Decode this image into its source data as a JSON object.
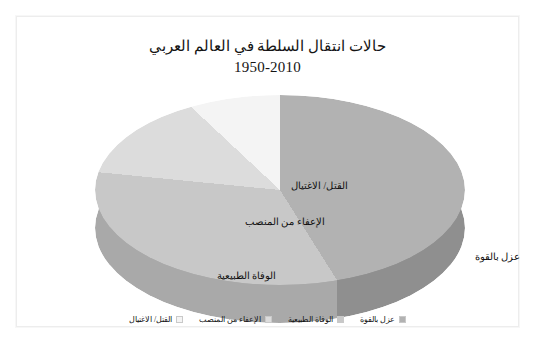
{
  "chart_data": {
    "type": "pie",
    "title": "حالات انتقال السلطة في العالم العربي",
    "subtitle": "1950-2010",
    "xlabel": "",
    "ylabel": "",
    "legend_position": "bottom",
    "grid": false,
    "three_d": true,
    "categories": [
      "عزل بالقوة",
      "الوفاة الطبيعية",
      "الإعفاء من المنصب",
      "القتل/ الاغتيال"
    ],
    "values": [
      45,
      33,
      14,
      8
    ],
    "colors": [
      "#b2b2b2",
      "#c8c8c8",
      "#dcdcdc",
      "#f4f4f4"
    ],
    "slice_labels": [
      {
        "name": "force-removal",
        "text": "عزل بالقوة"
      },
      {
        "name": "natural-death",
        "text": "الوفاة الطبيعية"
      },
      {
        "name": "removal-from-office",
        "text": "الإعفاء من المنصب"
      },
      {
        "name": "killing-assassination",
        "text": "القتل/ الاغتيال"
      }
    ]
  },
  "title": {
    "line1": "حالات انتقال السلطة في العالم العربي",
    "line2": "1950-2010"
  },
  "labels": {
    "kill": "القتل/ الاغتيال",
    "removal": "الإعفاء من المنصب",
    "death": "الوفاة الطبيعية",
    "force": "عزل بالقوة"
  },
  "legend": {
    "items": [
      {
        "label": "القتل/ الاغتيال",
        "color": "#f4f4f4"
      },
      {
        "label": "الإعفاء من المنصب",
        "color": "#dcdcdc"
      },
      {
        "label": "الوفاة الطبيعية",
        "color": "#c8c8c8"
      },
      {
        "label": "عزل بالقوة",
        "color": "#b2b2b2"
      }
    ]
  }
}
